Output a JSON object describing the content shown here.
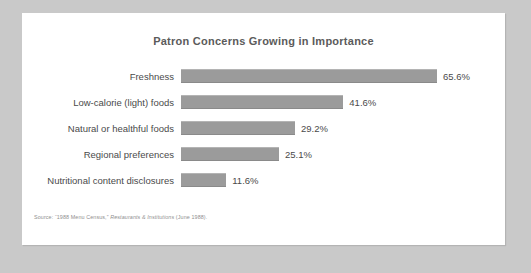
{
  "card": {
    "background_color": "#ffffff",
    "page_background_color": "#c9c9c9"
  },
  "chart_data": {
    "type": "bar",
    "orientation": "horizontal",
    "title": "Patron Concerns Growing in Importance",
    "xlabel": "",
    "ylabel": "",
    "categories": [
      "Freshness",
      "Low-calorie (light) foods",
      "Natural or healthful foods",
      "Regional preferences",
      "Nutritional content disclosures"
    ],
    "values": [
      65.6,
      41.6,
      29.2,
      25.1,
      11.6
    ],
    "value_labels": [
      "65.6%",
      "41.6%",
      "29.2%",
      "25.1%",
      "11.6%"
    ],
    "xlim": [
      0,
      65.6
    ],
    "grid": false,
    "legend": false,
    "bar_color": "#9b9b9b",
    "text_color": "#4a4a4a",
    "title_color": "#5b5b5b"
  },
  "source": {
    "prefix": "Source: “1988 Menu Census,” ",
    "publication": "Restaurants & Institutions",
    "suffix": " (June 1988)."
  }
}
